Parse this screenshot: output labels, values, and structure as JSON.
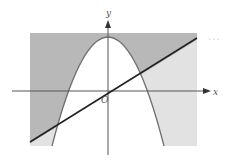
{
  "diagram": {
    "title": "",
    "axes": {
      "x_label": "x",
      "y_label": "y",
      "origin_label": "O"
    },
    "curves": [
      {
        "name": "parabola",
        "description": "downward-opening parabola with vertex on positive y-axis"
      },
      {
        "name": "line",
        "description": "straight line through origin with positive slope"
      }
    ],
    "regions": {
      "outside_parabola_above_line": "#b8b8b8",
      "outside_parabola_below_line": "#e2e2e2",
      "inside_parabola": "#ffffff"
    },
    "ellipsis": "..."
  },
  "colors": {
    "axis": "#555555",
    "parabola": "#707070",
    "line": "#222222",
    "dark_shade": "#b8b8b8",
    "light_shade": "#e2e2e2"
  }
}
